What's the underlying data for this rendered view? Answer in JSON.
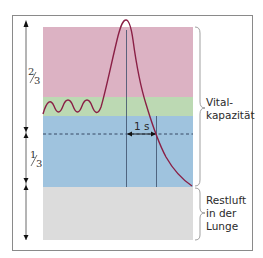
{
  "diagram": {
    "type": "lung volume / spirometry (Tiffeneau) diagram",
    "colors": {
      "inspiratory_reserve": "#dcb2c3",
      "tidal_volume": "#bcd9b3",
      "expiratory_reserve": "#9fc3de",
      "residual_volume": "#dcdcdc",
      "curve": "#8a1f45",
      "frame": "#888888"
    },
    "fractions": {
      "upper": {
        "num": "2",
        "den": "3"
      },
      "lower": {
        "num": "1",
        "den": "3"
      }
    },
    "time_marker": "1 s",
    "labels": {
      "vital_capacity_line1": "Vital-",
      "vital_capacity_line2": "kapazität",
      "residual_line1": "Restluft",
      "residual_line2": "in der",
      "residual_line3": "Lunge"
    }
  }
}
